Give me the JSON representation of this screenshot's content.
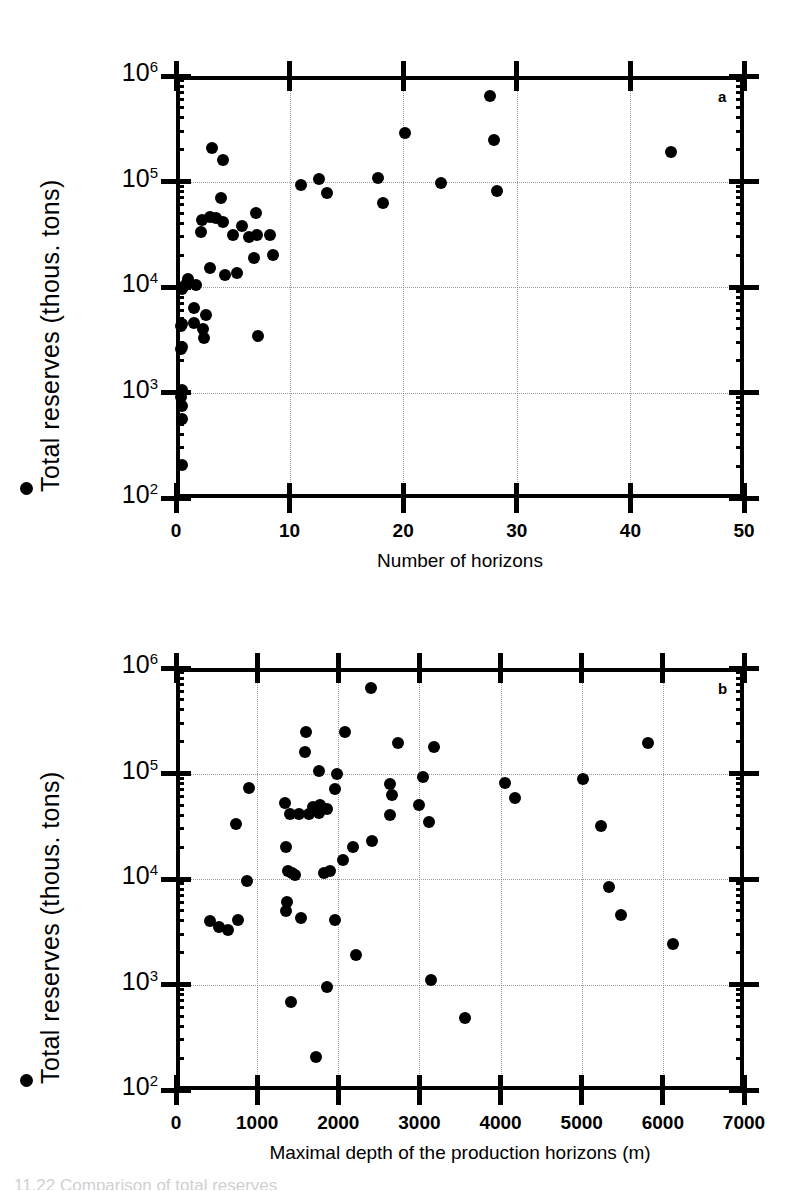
{
  "figure": {
    "caption_fragment": "11.22   Comparison of total reserves",
    "shared_ylabel": "Total reserves (thous. tons)",
    "ytick_labels": [
      "10",
      "10",
      "10",
      "10",
      "10"
    ],
    "ytick_exponents": [
      "6",
      "5",
      "4",
      "3",
      "2"
    ],
    "marker_color": "#000000",
    "grid_color": "#9a9a9a"
  },
  "panels": [
    {
      "id": "a",
      "label": "a",
      "xlabel": "Number of horizons",
      "ylabel": "Total reserves (thous. tons)",
      "xticks": [
        "0",
        "10",
        "20",
        "30",
        "40",
        "50"
      ]
    },
    {
      "id": "b",
      "label": "b",
      "xlabel": "Maximal depth of the production horizons (m)",
      "ylabel": "Total reserves (thous. tons)",
      "xticks": [
        "0",
        "1000",
        "2000",
        "3000",
        "4000",
        "5000",
        "6000",
        "7000"
      ]
    }
  ],
  "chart_data": [
    {
      "type": "scatter",
      "panel": "a",
      "title": "",
      "xlabel": "Number of horizons",
      "ylabel": "Total reserves (thous. tons)",
      "xlim": [
        0,
        50
      ],
      "ylim": [
        100,
        1000000
      ],
      "yscale": "log",
      "xscale": "linear",
      "grid": true,
      "xticks": [
        0,
        10,
        20,
        30,
        40,
        50
      ],
      "yticks": [
        100,
        1000,
        10000,
        100000,
        1000000
      ],
      "points": [
        {
          "x": 3.2,
          "y": 210000
        },
        {
          "x": 4.1,
          "y": 160000
        },
        {
          "x": 11.0,
          "y": 92000
        },
        {
          "x": 12.6,
          "y": 105000
        },
        {
          "x": 13.3,
          "y": 78000
        },
        {
          "x": 17.8,
          "y": 108000
        },
        {
          "x": 18.2,
          "y": 63000
        },
        {
          "x": 20.2,
          "y": 290000
        },
        {
          "x": 23.3,
          "y": 97000
        },
        {
          "x": 27.6,
          "y": 640000
        },
        {
          "x": 28.0,
          "y": 250000
        },
        {
          "x": 28.3,
          "y": 82000
        },
        {
          "x": 43.6,
          "y": 190000
        },
        {
          "x": 4.0,
          "y": 70000
        },
        {
          "x": 2.3,
          "y": 43000
        },
        {
          "x": 3.0,
          "y": 46000
        },
        {
          "x": 3.5,
          "y": 45000
        },
        {
          "x": 2.2,
          "y": 33000
        },
        {
          "x": 4.1,
          "y": 41000
        },
        {
          "x": 7.0,
          "y": 50000
        },
        {
          "x": 5.8,
          "y": 38000
        },
        {
          "x": 5.0,
          "y": 31000
        },
        {
          "x": 6.4,
          "y": 30000
        },
        {
          "x": 7.1,
          "y": 31000
        },
        {
          "x": 8.3,
          "y": 31000
        },
        {
          "x": 6.9,
          "y": 19000
        },
        {
          "x": 8.5,
          "y": 20000
        },
        {
          "x": 3.0,
          "y": 15000
        },
        {
          "x": 5.4,
          "y": 13500
        },
        {
          "x": 4.3,
          "y": 13000
        },
        {
          "x": 1.1,
          "y": 12000
        },
        {
          "x": 1.0,
          "y": 11000
        },
        {
          "x": 1.8,
          "y": 10500
        },
        {
          "x": 0.6,
          "y": 10000
        },
        {
          "x": 0.5,
          "y": 9500
        },
        {
          "x": 1.6,
          "y": 6300
        },
        {
          "x": 2.6,
          "y": 5400
        },
        {
          "x": 1.6,
          "y": 4600
        },
        {
          "x": 0.5,
          "y": 4500
        },
        {
          "x": 0.4,
          "y": 4300
        },
        {
          "x": 2.4,
          "y": 4000
        },
        {
          "x": 2.5,
          "y": 3300
        },
        {
          "x": 7.2,
          "y": 3400
        },
        {
          "x": 0.5,
          "y": 2700
        },
        {
          "x": 0.4,
          "y": 2600
        },
        {
          "x": 0.5,
          "y": 1050
        },
        {
          "x": 0.4,
          "y": 900
        },
        {
          "x": 0.5,
          "y": 750
        },
        {
          "x": 0.5,
          "y": 560
        },
        {
          "x": 0.5,
          "y": 205
        }
      ]
    },
    {
      "type": "scatter",
      "panel": "b",
      "title": "",
      "xlabel": "Maximal depth of the production horizons (m)",
      "ylabel": "Total reserves (thous. tons)",
      "xlim": [
        0,
        7000
      ],
      "ylim": [
        100,
        1000000
      ],
      "yscale": "log",
      "xscale": "linear",
      "grid": true,
      "xticks": [
        0,
        1000,
        2000,
        3000,
        4000,
        5000,
        6000,
        7000
      ],
      "yticks": [
        100,
        1000,
        10000,
        100000,
        1000000
      ],
      "points": [
        {
          "x": 2400,
          "y": 640000
        },
        {
          "x": 1600,
          "y": 250000
        },
        {
          "x": 2080,
          "y": 245000
        },
        {
          "x": 2740,
          "y": 195000
        },
        {
          "x": 3180,
          "y": 180000
        },
        {
          "x": 1590,
          "y": 160000
        },
        {
          "x": 5820,
          "y": 195000
        },
        {
          "x": 1760,
          "y": 105000
        },
        {
          "x": 1980,
          "y": 98000
        },
        {
          "x": 2640,
          "y": 80000
        },
        {
          "x": 3040,
          "y": 93000
        },
        {
          "x": 4060,
          "y": 82000
        },
        {
          "x": 5020,
          "y": 88000
        },
        {
          "x": 1960,
          "y": 72000
        },
        {
          "x": 900,
          "y": 73000
        },
        {
          "x": 2660,
          "y": 62000
        },
        {
          "x": 4180,
          "y": 58000
        },
        {
          "x": 2990,
          "y": 50000
        },
        {
          "x": 1340,
          "y": 52000
        },
        {
          "x": 1780,
          "y": 50000
        },
        {
          "x": 1690,
          "y": 48000
        },
        {
          "x": 1860,
          "y": 46000
        },
        {
          "x": 1400,
          "y": 41000
        },
        {
          "x": 1510,
          "y": 41000
        },
        {
          "x": 1640,
          "y": 41000
        },
        {
          "x": 1760,
          "y": 42000
        },
        {
          "x": 2640,
          "y": 40000
        },
        {
          "x": 740,
          "y": 33000
        },
        {
          "x": 5240,
          "y": 32000
        },
        {
          "x": 3120,
          "y": 35000
        },
        {
          "x": 1360,
          "y": 20000
        },
        {
          "x": 2180,
          "y": 20000
        },
        {
          "x": 2420,
          "y": 23000
        },
        {
          "x": 2060,
          "y": 15000
        },
        {
          "x": 1380,
          "y": 12000
        },
        {
          "x": 1430,
          "y": 11500
        },
        {
          "x": 1470,
          "y": 11000
        },
        {
          "x": 1830,
          "y": 11500
        },
        {
          "x": 1900,
          "y": 12000
        },
        {
          "x": 880,
          "y": 9500
        },
        {
          "x": 5340,
          "y": 8400
        },
        {
          "x": 1370,
          "y": 6000
        },
        {
          "x": 1360,
          "y": 5000
        },
        {
          "x": 420,
          "y": 4000
        },
        {
          "x": 530,
          "y": 3500
        },
        {
          "x": 640,
          "y": 3300
        },
        {
          "x": 760,
          "y": 4100
        },
        {
          "x": 1540,
          "y": 4300
        },
        {
          "x": 1960,
          "y": 4100
        },
        {
          "x": 5480,
          "y": 4600
        },
        {
          "x": 6120,
          "y": 2400
        },
        {
          "x": 2220,
          "y": 1900
        },
        {
          "x": 3140,
          "y": 1100
        },
        {
          "x": 1860,
          "y": 950
        },
        {
          "x": 1420,
          "y": 690
        },
        {
          "x": 3560,
          "y": 480
        },
        {
          "x": 1730,
          "y": 205
        }
      ]
    }
  ]
}
